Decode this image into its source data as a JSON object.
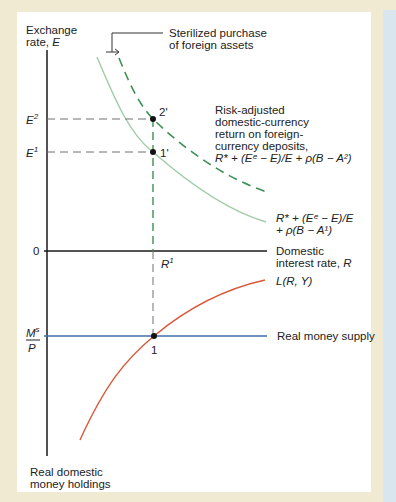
{
  "diagram": {
    "axes": {
      "y_label_line1": "Exchange",
      "y_label_line2_prefix": "rate, ",
      "y_label_var": "E",
      "x_label_line1": "Domestic",
      "x_label_line2_prefix": "interest rate, ",
      "x_label_var": "R",
      "origin_label": "0",
      "lower_axis_line1": "Real domestic",
      "lower_axis_line2": "money holdings"
    },
    "ticks": {
      "E2_var": "E",
      "E2_sup": "2",
      "E1_var": "E",
      "E1_sup": "1",
      "R1_var": "R",
      "R1_sup": "1",
      "Ms_num": "M",
      "Ms_sup": "s",
      "Ms_den": "P"
    },
    "points": {
      "p2prime": "2'",
      "p1prime": "1'",
      "p1": "1"
    },
    "annotations": {
      "callout_line1": "Sterilized purchase",
      "callout_line2": "of foreign assets",
      "risk_line1": "Risk-adjusted",
      "risk_line2": "domestic-currency",
      "risk_line3": "return on foreign-",
      "risk_line4": "currency deposits,",
      "risk_formula": "R* + (Eᵉ − E)/E + ρ(B − A²)",
      "curve1_formula_line1": "R* + (Eᵉ − E)/E",
      "curve1_formula_line2": "+ ρ(B − A¹)",
      "money_demand": "L(R, Y)",
      "money_supply": "Real money supply"
    },
    "colors": {
      "axis": "#1a1a1a",
      "curve_original": "#9fcca6",
      "curve_shifted": "#3e8f55",
      "money_demand": "#d9583a",
      "money_supply": "#3f6ea8",
      "guide": "#707070",
      "border": "#f1ead2",
      "side_strip": "#d9e6f0"
    }
  }
}
